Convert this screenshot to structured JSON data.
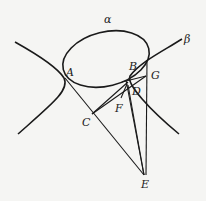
{
  "diagram": {
    "curves": [
      {
        "name": "alpha",
        "type": "ellipse",
        "label": "α"
      },
      {
        "name": "beta",
        "type": "hyperbola",
        "label": "β"
      }
    ],
    "points": [
      {
        "name": "A",
        "label": "A"
      },
      {
        "name": "B",
        "label": "B"
      },
      {
        "name": "C",
        "label": "C"
      },
      {
        "name": "D",
        "label": "D"
      },
      {
        "name": "E",
        "label": "E"
      },
      {
        "name": "F",
        "label": "F"
      },
      {
        "name": "G",
        "label": "G"
      }
    ],
    "segments": [
      [
        "A",
        "E"
      ],
      [
        "C",
        "B"
      ],
      [
        "C",
        "G"
      ],
      [
        "B",
        "E"
      ],
      [
        "G",
        "E"
      ],
      [
        "D",
        "E"
      ],
      [
        "F",
        "B"
      ]
    ]
  }
}
